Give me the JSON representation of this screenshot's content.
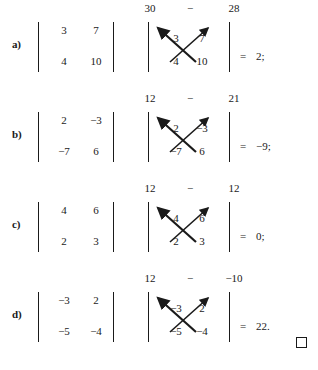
{
  "document": {
    "type": "determinant-worked-examples",
    "minus_sign": "−",
    "qed_symbol": "□"
  },
  "rows": [
    {
      "label": "a)",
      "matrix": {
        "a11": "3",
        "a12": "7",
        "a21": "4",
        "a22": "10"
      },
      "products": {
        "left": "30",
        "operator": "−",
        "right": "28"
      },
      "result": {
        "equals": "=",
        "value": "2;"
      }
    },
    {
      "label": "b)",
      "matrix": {
        "a11": "2",
        "a12": "−3",
        "a21": "−7",
        "a22": "6"
      },
      "products": {
        "left": "12",
        "operator": "−",
        "right": "21"
      },
      "result": {
        "equals": "=",
        "value": "−9;"
      }
    },
    {
      "label": "c)",
      "matrix": {
        "a11": "4",
        "a12": "6",
        "a21": "2",
        "a22": "3"
      },
      "products": {
        "left": "12",
        "operator": "−",
        "right": "12"
      },
      "result": {
        "equals": "=",
        "value": "0;"
      }
    },
    {
      "label": "d)",
      "matrix": {
        "a11": "−3",
        "a12": "2",
        "a21": "−5",
        "a22": "−4"
      },
      "products": {
        "left": "12",
        "operator": "−",
        "right": "−10"
      },
      "result": {
        "equals": "=",
        "value": "22."
      }
    }
  ],
  "colors": {
    "ink": "#1a1a1a",
    "page": "#ffffff"
  }
}
